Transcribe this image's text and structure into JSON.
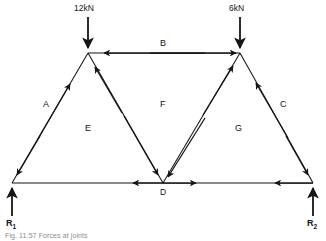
{
  "figure": {
    "title": "Forces at joints",
    "caption": "Fig. 11.57  Forces at joints",
    "type": "truss-force-diagram",
    "stroke_color": "#141414",
    "background_color": "#ffffff"
  },
  "loads": [
    {
      "name": "left-load",
      "label": "12kN",
      "direction": "down",
      "at_node": "top-left-apex"
    },
    {
      "name": "right-load",
      "label": "6kN",
      "direction": "down",
      "at_node": "top-right-apex"
    }
  ],
  "reactions": [
    {
      "name": "left-reaction",
      "label": "R",
      "subscript": "1",
      "direction": "up",
      "at_node": "left-support"
    },
    {
      "name": "right-reaction",
      "label": "R",
      "subscript": "2",
      "direction": "up",
      "at_node": "right-support"
    }
  ],
  "members": [
    {
      "id": "A",
      "label": "A",
      "from": "left-support",
      "to": "top-left-apex"
    },
    {
      "id": "B",
      "label": "B",
      "from": "top-left-apex",
      "to": "top-right-apex"
    },
    {
      "id": "C",
      "label": "C",
      "from": "top-right-apex",
      "to": "right-support"
    },
    {
      "id": "E",
      "label": "E",
      "from": "top-left-apex",
      "to": "node-D"
    },
    {
      "id": "F",
      "label": "F",
      "from": "node-D",
      "to": "top-right-apex"
    },
    {
      "id": "G",
      "label": "G",
      "from": "node-D",
      "to": "right-support"
    }
  ],
  "region_labels": [
    {
      "id": "A",
      "label": "A"
    },
    {
      "id": "B",
      "label": "B"
    },
    {
      "id": "C",
      "label": "C"
    },
    {
      "id": "E",
      "label": "E"
    },
    {
      "id": "F",
      "label": "F"
    },
    {
      "id": "G",
      "label": "G"
    }
  ],
  "nodes": [
    {
      "id": "node-D",
      "label": "D",
      "x": 163,
      "y": 183
    },
    {
      "id": "left-support",
      "label": "",
      "x": 12,
      "y": 183
    },
    {
      "id": "right-support",
      "label": "",
      "x": 313,
      "y": 183
    },
    {
      "id": "top-left-apex",
      "label": "",
      "x": 88,
      "y": 53
    },
    {
      "id": "top-right-apex",
      "label": "",
      "x": 240,
      "y": 53
    }
  ]
}
